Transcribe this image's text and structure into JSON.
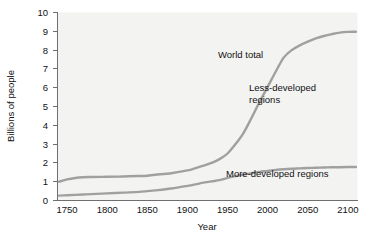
{
  "chart_data": {
    "type": "line",
    "title": "",
    "xlabel": "Year",
    "ylabel": "Billions of people",
    "xlim": [
      1738,
      2112
    ],
    "ylim": [
      0,
      10
    ],
    "grid": false,
    "legend_position": "inline-annotations",
    "xticks": [
      "1750",
      "1800",
      "1850",
      "1900",
      "1950",
      "2000",
      "2050",
      "2100"
    ],
    "xtick_values": [
      1750,
      1800,
      1850,
      1900,
      1950,
      2000,
      2050,
      2100
    ],
    "yticks": [
      "0",
      "1",
      "2",
      "3",
      "4",
      "5",
      "6",
      "7",
      "8",
      "9",
      "10"
    ],
    "ytick_values": [
      0,
      1,
      2,
      3,
      4,
      5,
      6,
      7,
      8,
      9,
      10
    ],
    "x": [
      1740,
      1750,
      1760,
      1770,
      1780,
      1800,
      1820,
      1840,
      1850,
      1860,
      1880,
      1900,
      1910,
      1920,
      1930,
      1940,
      1950,
      1960,
      1970,
      1980,
      1990,
      2000,
      2010,
      2020,
      2030,
      2040,
      2050,
      2060,
      2070,
      2080,
      2090,
      2100,
      2110
    ],
    "series": [
      {
        "name": "World total",
        "color": "#a0a0a0",
        "values": [
          1.0,
          1.12,
          1.2,
          1.24,
          1.25,
          1.26,
          1.28,
          1.3,
          1.32,
          1.37,
          1.45,
          1.6,
          1.72,
          1.85,
          2.0,
          2.2,
          2.5,
          3.0,
          3.6,
          4.4,
          5.25,
          6.05,
          6.85,
          7.6,
          8.0,
          8.25,
          8.45,
          8.62,
          8.75,
          8.85,
          8.93,
          8.97,
          8.98
        ]
      },
      {
        "name": "More-developed regions",
        "color": "#a0a0a0",
        "values": [
          0.26,
          0.28,
          0.3,
          0.32,
          0.34,
          0.38,
          0.42,
          0.46,
          0.5,
          0.54,
          0.64,
          0.78,
          0.86,
          0.95,
          1.02,
          1.08,
          1.2,
          1.3,
          1.38,
          1.45,
          1.52,
          1.57,
          1.62,
          1.66,
          1.69,
          1.71,
          1.73,
          1.74,
          1.755,
          1.765,
          1.772,
          1.778,
          1.78
        ]
      }
    ],
    "annotations": [
      {
        "text": "World total",
        "x_px": 218,
        "y_px": 58
      },
      {
        "text": "Less-developed",
        "x_px": 249,
        "y_px": 91
      },
      {
        "text": "regions",
        "x_px": 249,
        "y_px": 103
      },
      {
        "text": "More-developed regions",
        "x_px": 226,
        "y_px": 177
      }
    ],
    "region_fill_note": "shaded plot background"
  }
}
